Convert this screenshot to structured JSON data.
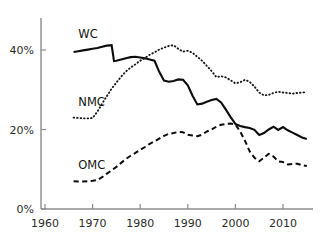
{
  "chart_data": {
    "type": "line",
    "title": "",
    "subtitle": "",
    "xlabel": "",
    "ylabel": "",
    "xlim": [
      1960,
      2016
    ],
    "ylim": [
      0,
      44
    ],
    "grid": false,
    "legend_position": "inline-labels",
    "x_ticks": [
      "1960",
      "1970",
      "1980",
      "1990",
      "2000",
      "2010"
    ],
    "x_tick_values": [
      1960,
      1970,
      1980,
      1990,
      2000,
      2010
    ],
    "y_ticks": [
      "0%",
      "20%",
      "40%"
    ],
    "y_tick_values": [
      0,
      20,
      40
    ],
    "series": [
      {
        "name": "WC",
        "style": "solid",
        "label": "WC",
        "x": [
          1966,
          1967,
          1968,
          1969,
          1970,
          1971,
          1972,
          1973,
          1974,
          1974.5,
          1975,
          1976,
          1977,
          1978,
          1979,
          1980,
          1981,
          1982,
          1983,
          1984,
          1985,
          1986,
          1987,
          1988,
          1989,
          1990,
          1991,
          1992,
          1993,
          1994,
          1995,
          1996,
          1997,
          1998,
          1999,
          2000,
          2001,
          2002,
          2003,
          2004,
          2005,
          2006,
          2007,
          2008,
          2009,
          2010,
          2011,
          2012,
          2013,
          2014,
          2015
        ],
        "values": [
          39.5,
          39.7,
          39.9,
          40.1,
          40.3,
          40.5,
          40.8,
          41.1,
          41.2,
          37.2,
          37.3,
          37.6,
          37.9,
          38.2,
          38.3,
          38.1,
          37.9,
          37.6,
          37.3,
          34.5,
          32.3,
          32.0,
          32.2,
          32.6,
          32.5,
          31.1,
          28.5,
          26.3,
          26.5,
          27.0,
          27.4,
          27.7,
          26.8,
          25.0,
          23.1,
          21.4,
          20.9,
          20.6,
          20.4,
          19.9,
          18.6,
          19.1,
          20.0,
          20.7,
          19.9,
          20.6,
          19.8,
          19.2,
          18.6,
          18.0,
          17.6
        ]
      },
      {
        "name": "NMC",
        "style": "dotted",
        "label": "NMC",
        "x": [
          1966,
          1967,
          1968,
          1969,
          1970,
          1971,
          1972,
          1973,
          1974,
          1975,
          1976,
          1977,
          1978,
          1979,
          1980,
          1981,
          1982,
          1983,
          1984,
          1985,
          1986,
          1987,
          1988,
          1989,
          1990,
          1991,
          1992,
          1993,
          1994,
          1995,
          1996,
          1997,
          1998,
          1999,
          2000,
          2001,
          2002,
          2003,
          2004,
          2005,
          2006,
          2007,
          2008,
          2009,
          2010,
          2011,
          2012,
          2013,
          2014,
          2015
        ],
        "values": [
          23.0,
          22.9,
          22.8,
          22.8,
          22.9,
          24.5,
          26.5,
          28.4,
          30.3,
          31.8,
          33.3,
          34.6,
          35.6,
          36.4,
          37.3,
          38.0,
          38.8,
          39.4,
          40.1,
          40.6,
          41.0,
          41.2,
          40.3,
          39.6,
          39.8,
          39.3,
          38.3,
          37.3,
          36.0,
          34.7,
          33.2,
          33.4,
          33.1,
          32.4,
          31.6,
          31.9,
          32.5,
          32.0,
          30.8,
          29.3,
          28.6,
          28.7,
          29.2,
          29.5,
          29.3,
          29.2,
          29.0,
          29.2,
          29.3,
          29.4
        ]
      },
      {
        "name": "OMC",
        "style": "dashed",
        "label": "OMC",
        "x": [
          1966,
          1967,
          1968,
          1969,
          1970,
          1971,
          1972,
          1973,
          1974,
          1975,
          1976,
          1977,
          1978,
          1979,
          1980,
          1981,
          1982,
          1983,
          1984,
          1985,
          1986,
          1987,
          1988,
          1989,
          1990,
          1991,
          1992,
          1993,
          1994,
          1995,
          1996,
          1997,
          1998,
          1999,
          2000,
          2001,
          2002,
          2003,
          2004,
          2005,
          2006,
          2007,
          2008,
          2009,
          2010,
          2011,
          2012,
          2013,
          2014,
          2015
        ],
        "values": [
          7.0,
          6.9,
          6.9,
          7.0,
          7.1,
          7.3,
          8.0,
          8.9,
          9.7,
          10.6,
          11.6,
          12.6,
          13.4,
          14.1,
          14.9,
          15.6,
          16.4,
          17.0,
          17.7,
          18.4,
          18.9,
          19.1,
          19.4,
          19.3,
          18.7,
          18.5,
          18.3,
          18.7,
          19.5,
          20.0,
          20.7,
          21.2,
          21.4,
          21.5,
          21.3,
          19.5,
          17.2,
          14.5,
          12.9,
          12.0,
          12.9,
          13.9,
          13.2,
          12.0,
          11.8,
          11.2,
          11.3,
          11.4,
          11.0,
          10.8
        ]
      }
    ],
    "annotations": [
      {
        "text": "WC",
        "x": 1967,
        "y": 43.0
      },
      {
        "text": "NMC",
        "x": 1967,
        "y": 26.0
      },
      {
        "text": "OMC",
        "x": 1967,
        "y": 10.0
      }
    ]
  },
  "colors": {
    "axis": "#8c8c8c",
    "text": "#1a1a1a",
    "series_wc": "#0d0d0d",
    "series_nmc": "#1a1a1a",
    "series_omc": "#0d0d0d",
    "background": "#ffffff"
  }
}
